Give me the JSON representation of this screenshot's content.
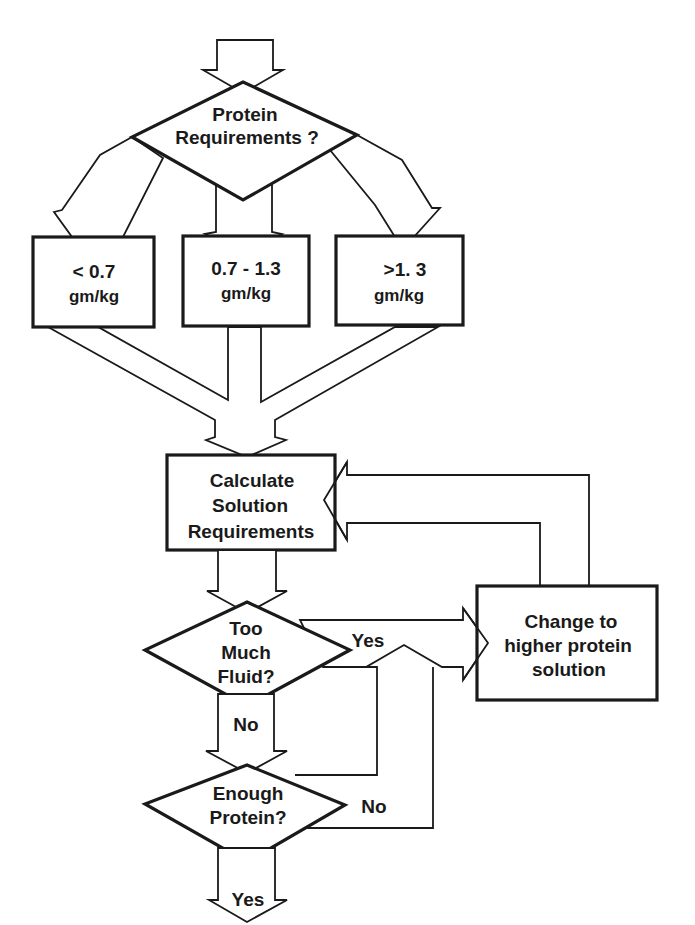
{
  "diagram": {
    "type": "flowchart",
    "nodes": {
      "protein_req": {
        "kind": "decision",
        "lines": [
          "Protein",
          "Requirements ?"
        ]
      },
      "low": {
        "kind": "box",
        "lines": [
          "< 0.7",
          "gm/kg"
        ]
      },
      "mid": {
        "kind": "box",
        "lines": [
          "0.7 - 1.3",
          "gm/kg"
        ]
      },
      "high": {
        "kind": "box",
        "lines": [
          ">1. 3",
          "gm/kg"
        ]
      },
      "calc": {
        "kind": "box",
        "lines": [
          "Calculate",
          "Solution",
          "Requirements"
        ]
      },
      "fluid": {
        "kind": "decision",
        "lines": [
          "Too",
          "Much",
          "Fluid?"
        ]
      },
      "change": {
        "kind": "box",
        "lines": [
          "Change to",
          "higher protein",
          "solution"
        ]
      },
      "enough": {
        "kind": "decision",
        "lines": [
          "Enough",
          "Protein?"
        ]
      }
    },
    "edge_labels": {
      "fluid_yes": "Yes",
      "fluid_no": "No",
      "enough_no": "No",
      "enough_yes": "Yes"
    },
    "edges": [
      {
        "from": "start",
        "to": "protein_req"
      },
      {
        "from": "protein_req",
        "to": "low"
      },
      {
        "from": "protein_req",
        "to": "mid"
      },
      {
        "from": "protein_req",
        "to": "high"
      },
      {
        "from": "low",
        "to": "calc"
      },
      {
        "from": "mid",
        "to": "calc"
      },
      {
        "from": "high",
        "to": "calc"
      },
      {
        "from": "calc",
        "to": "fluid"
      },
      {
        "from": "fluid",
        "to": "change",
        "label": "Yes"
      },
      {
        "from": "fluid",
        "to": "enough",
        "label": "No"
      },
      {
        "from": "enough",
        "to": "change",
        "label": "No"
      },
      {
        "from": "enough",
        "to": "end",
        "label": "Yes"
      },
      {
        "from": "change",
        "to": "calc"
      }
    ]
  }
}
